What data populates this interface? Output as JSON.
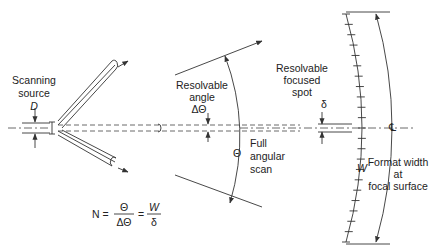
{
  "diagram": {
    "title_hidden": "",
    "labels": {
      "source_line1": "Scanning",
      "source_line2": "source",
      "source_symbol": "D",
      "resolvable_angle_line1": "Resolvable",
      "resolvable_angle_line2": "angle",
      "resolvable_angle_symbol": "ΔΘ",
      "full_scan_line1": "Full",
      "full_scan_line2": "angular",
      "full_scan_line3": "scan",
      "full_scan_symbol": "Θ",
      "spot_line1": "Resolvable",
      "spot_line2": "focused",
      "spot_line3": "spot",
      "spot_symbol": "δ",
      "centerline_symbol": "℄",
      "format_line1": "Format width",
      "format_line2": "at",
      "format_line3": "focal surface",
      "format_symbol": "W"
    },
    "equation": {
      "lhs": "N =",
      "frac1_num": "Θ",
      "frac1_den": "ΔΘ",
      "eq2": "=",
      "frac2_num": "W",
      "frac2_den": "δ"
    },
    "colors": {
      "stroke": "#333333",
      "text": "#222222",
      "background": "#ffffff"
    }
  }
}
